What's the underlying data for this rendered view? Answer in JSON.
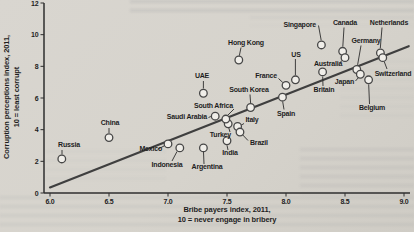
{
  "figure": {
    "x_axis_title_line1": "Bribe payers index, 2011,",
    "x_axis_title_line2": "10 = never engage in bribery",
    "y_axis_title_line1": "Corruption perceptions index, 2011,",
    "y_axis_title_line2": "10 = least corrupt"
  },
  "colors": {
    "paper": "#d6d3cc",
    "ink": "#1e1e1e",
    "axis": "#2e2e2e",
    "trend_line": "#3f3f3f",
    "marker_fill": "#f0eee9",
    "marker_stroke": "#474747",
    "bleed_through": "#484e62"
  },
  "chart_data": {
    "type": "scatter",
    "title": "",
    "xlabel": "Bribe payers index, 2011, 10 = never engage in bribery",
    "ylabel": "Corruption perceptions index, 2011, 10 = least corrupt",
    "xlim": [
      6.0,
      9.0
    ],
    "ylim": [
      0,
      12
    ],
    "x_ticks": [
      6.0,
      6.5,
      7.0,
      7.5,
      8.0,
      8.5,
      9.0
    ],
    "x_tick_labels": [
      "6.0",
      "6.5",
      "7.0",
      "7.5",
      "8.0",
      "8.5",
      "9.0"
    ],
    "y_ticks": [
      0,
      2,
      4,
      6,
      8,
      10,
      12
    ],
    "y_tick_labels": [
      "0",
      "2",
      "4",
      "6",
      "8",
      "10",
      "12"
    ],
    "grid": false,
    "legend": "none",
    "marker": "open-circle",
    "trend_line": {
      "x1": 6.0,
      "y1": 0.35,
      "x2": 9.04,
      "y2": 9.27
    },
    "points": [
      {
        "name": "Russia",
        "x": 6.1,
        "y": 2.15,
        "label": {
          "lx": 69,
          "ly": 147,
          "ha": "middle"
        },
        "leader": [
          62,
          150,
          62,
          154.5
        ]
      },
      {
        "name": "China",
        "x": 6.5,
        "y": 3.5,
        "label": {
          "lx": 110,
          "ly": 125,
          "ha": "middle"
        },
        "leader": [
          109,
          128,
          109,
          133
        ]
      },
      {
        "name": "Mexico",
        "x": 7.0,
        "y": 3.1,
        "label": {
          "lx": 162,
          "ly": 151,
          "ha": "end"
        },
        "leader": [
          158,
          149,
          164,
          146
        ]
      },
      {
        "name": "Indonesia",
        "x": 7.1,
        "y": 2.85,
        "label": {
          "lx": 167,
          "ly": 167,
          "ha": "middle"
        },
        "leader": [
          172,
          161,
          177,
          151.5
        ]
      },
      {
        "name": "Argentina",
        "x": 7.3,
        "y": 2.85,
        "label": {
          "lx": 207,
          "ly": 169,
          "ha": "middle"
        },
        "leader": [
          204,
          164,
          203.5,
          152
        ]
      },
      {
        "name": "India",
        "x": 7.5,
        "y": 3.3,
        "label": {
          "lx": 230,
          "ly": 155,
          "ha": "middle"
        },
        "leader": [
          228,
          150,
          227,
          145.3
        ]
      },
      {
        "name": "Turkey",
        "x": 7.51,
        "y": 4.37,
        "label": {
          "lx": 231,
          "ly": 137,
          "ha": "end"
        },
        "leader": [
          230,
          132,
          228.8,
          128
        ]
      },
      {
        "name": "Saudi Arabia",
        "x": 7.4,
        "y": 4.85,
        "label": {
          "lx": 207,
          "ly": 119,
          "ha": "end"
        },
        "leader": [
          208.5,
          117.5,
          210.8,
          116.5
        ]
      },
      {
        "name": "South Africa",
        "x": 7.49,
        "y": 4.67,
        "label": {
          "lx": 233,
          "ly": 107.5,
          "ha": "end"
        },
        "leader": [
          234,
          109,
          227.5,
          115.5
        ]
      },
      {
        "name": "Italy",
        "x": 7.59,
        "y": 4.2,
        "label": {
          "lx": 245.5,
          "ly": 122,
          "ha": "start"
        },
        "leader": [
          244,
          123.5,
          241,
          125.3
        ]
      },
      {
        "name": "Brazil",
        "x": 7.61,
        "y": 3.85,
        "label": {
          "lx": 250,
          "ly": 144.5,
          "ha": "start"
        },
        "leader": [
          248,
          140.5,
          242.8,
          135
        ]
      },
      {
        "name": "UAE",
        "x": 7.3,
        "y": 6.3,
        "label": {
          "lx": 202,
          "ly": 77.5,
          "ha": "middle"
        },
        "leader": [
          203.4,
          81,
          203.4,
          88.5
        ]
      },
      {
        "name": "South Korea",
        "x": 7.7,
        "y": 5.4,
        "label": {
          "lx": 249,
          "ly": 91.5,
          "ha": "middle"
        },
        "leader": [
          250,
          94.5,
          250.6,
          103
        ]
      },
      {
        "name": "Spain",
        "x": 7.97,
        "y": 6.05,
        "label": {
          "lx": 286,
          "ly": 115.5,
          "ha": "middle"
        },
        "leader": [
          284,
          109.5,
          282.7,
          101.7
        ]
      },
      {
        "name": "France",
        "x": 8.0,
        "y": 6.8,
        "label": {
          "lx": 277,
          "ly": 77.5,
          "ha": "end"
        },
        "leader": [
          278.5,
          78.5,
          282.8,
          82.5
        ]
      },
      {
        "name": "US",
        "x": 8.08,
        "y": 7.15,
        "label": {
          "lx": 296,
          "ly": 56.5,
          "ha": "middle"
        },
        "leader": [
          295.4,
          59,
          295.4,
          75.2
        ]
      },
      {
        "name": "Hong Kong",
        "x": 7.6,
        "y": 8.4,
        "label": {
          "lx": 246,
          "ly": 44.5,
          "ha": "middle"
        },
        "leader": [
          241,
          47.5,
          239.3,
          55.8
        ]
      },
      {
        "name": "Singapore",
        "x": 8.3,
        "y": 9.35,
        "label": {
          "lx": 316,
          "ly": 26.5,
          "ha": "end"
        },
        "leader": [
          318.5,
          25.5,
          321.2,
          40.3
        ]
      },
      {
        "name": "Canada",
        "x": 8.48,
        "y": 8.95,
        "label": {
          "lx": 345,
          "ly": 24.5,
          "ha": "middle"
        },
        "leader": [
          344,
          27.5,
          342.8,
          46.7
        ]
      },
      {
        "name": "Australia",
        "x": 8.5,
        "y": 8.55,
        "label": {
          "lx": 328,
          "ly": 66,
          "ha": "middle"
        },
        "leader": [
          340,
          62.5,
          342.3,
          60.3
        ]
      },
      {
        "name": "Britain",
        "x": 8.31,
        "y": 7.65,
        "label": {
          "lx": 324,
          "ly": 92,
          "ha": "middle"
        },
        "leader": [
          323,
          86,
          322.7,
          76.5
        ]
      },
      {
        "name": "Germany",
        "x": 8.6,
        "y": 7.8,
        "label": {
          "lx": 366,
          "ly": 42.5,
          "ha": "middle"
        },
        "leader": [
          361,
          45.5,
          357.6,
          64.9
        ]
      },
      {
        "name": "Japan",
        "x": 8.63,
        "y": 7.5,
        "label": {
          "lx": 354,
          "ly": 84,
          "ha": "end"
        },
        "leader": [
          355.5,
          81,
          358.5,
          77.5
        ]
      },
      {
        "name": "Netherlands",
        "x": 8.8,
        "y": 8.85,
        "label": {
          "lx": 389,
          "ly": 24.5,
          "ha": "middle"
        },
        "leader": [
          382,
          27.5,
          380.3,
          48.3
        ]
      },
      {
        "name": "Switzerland",
        "x": 8.82,
        "y": 8.55,
        "label": {
          "lx": 393,
          "ly": 75.5,
          "ha": "middle"
        },
        "leader": [
          387,
          69,
          384.2,
          61.5
        ]
      },
      {
        "name": "Belgium",
        "x": 8.7,
        "y": 7.15,
        "label": {
          "lx": 372,
          "ly": 110,
          "ha": "middle"
        },
        "leader": [
          369.5,
          104,
          368.7,
          84.4
        ]
      }
    ]
  }
}
